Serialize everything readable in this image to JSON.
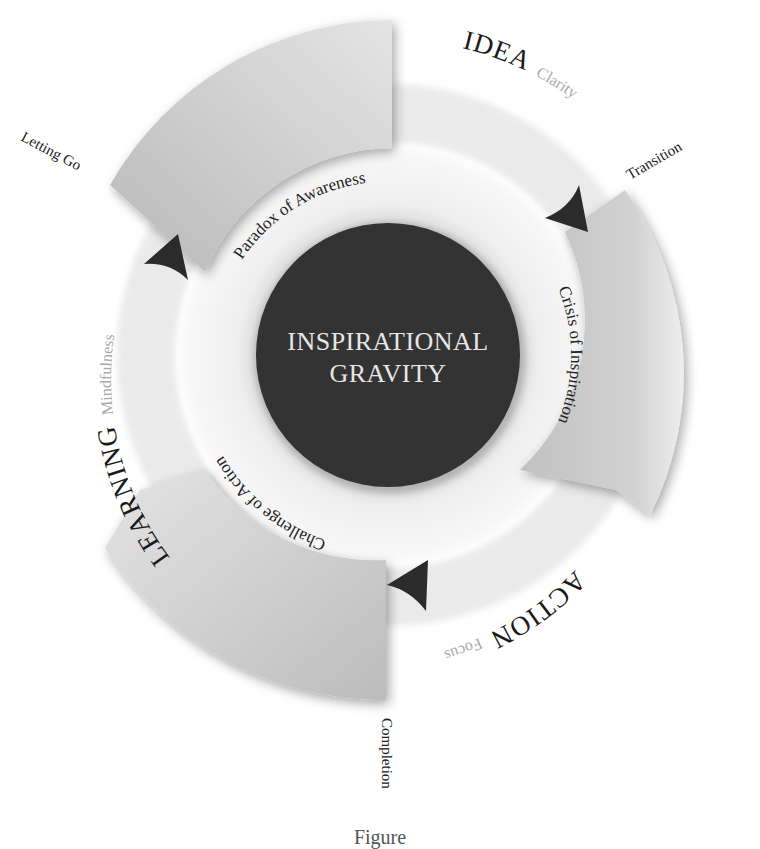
{
  "center": {
    "line1": "INSPIRATIONAL",
    "line2": "GRAVITY",
    "fill_color": "#333333",
    "text_color": "#e6e6e6"
  },
  "phases": [
    {
      "name": "IDEA",
      "quality": "Clarity"
    },
    {
      "name": "ACTION",
      "quality": "Focus"
    },
    {
      "name": "LEARNING",
      "quality": "Mindfulness"
    }
  ],
  "segments": [
    {
      "label": "Paradox of Awareness",
      "color": "#bdbdbd"
    },
    {
      "label": "Crisis of Inspiration",
      "color": "#c4c4c4"
    },
    {
      "label": "Challenge of Action",
      "color": "#c9c9c9"
    }
  ],
  "transitions": [
    {
      "label": "Letting Go"
    },
    {
      "label": "Transition"
    },
    {
      "label": "Completion"
    }
  ],
  "arrows": [
    {
      "icon": "arrowhead-icon",
      "color": "#2b2b2b"
    }
  ],
  "caption": "Figure"
}
